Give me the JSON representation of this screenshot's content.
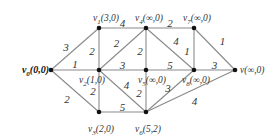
{
  "graph": {
    "nodes": [
      {
        "id": "v0",
        "label": "v0(0,0)",
        "name": "v",
        "sub": "0",
        "tail": "(0,0)",
        "x": 51,
        "y": 70,
        "bold": true
      },
      {
        "id": "v1",
        "label": "v1(3,0)",
        "name": "v",
        "sub": "1",
        "tail": "(3,0)",
        "x": 99,
        "y": 28
      },
      {
        "id": "v2",
        "label": "v2(1,0)",
        "name": "v",
        "sub": "2",
        "tail": "(1,0)",
        "x": 99,
        "y": 70
      },
      {
        "id": "v3",
        "label": "v3(2,0)",
        "name": "v",
        "sub": "3",
        "tail": "(2,0)",
        "x": 99,
        "y": 112
      },
      {
        "id": "v4",
        "label": "v4(∞,0)",
        "name": "v",
        "sub": "4",
        "tail": "(∞,0)",
        "x": 146,
        "y": 28
      },
      {
        "id": "v5",
        "label": "v5(∞,0)",
        "name": "v",
        "sub": "5",
        "tail": "(∞,0)",
        "x": 146,
        "y": 70
      },
      {
        "id": "v6",
        "label": "v6(5,2)",
        "name": "v",
        "sub": "6",
        "tail": "(5,2)",
        "x": 146,
        "y": 112
      },
      {
        "id": "v7",
        "label": "v7(∞,0)",
        "name": "v",
        "sub": "7",
        "tail": "(∞,0)",
        "x": 194,
        "y": 28
      },
      {
        "id": "v8",
        "label": "v8(∞,0)",
        "name": "v",
        "sub": "8",
        "tail": "(∞,0)",
        "x": 194,
        "y": 70
      },
      {
        "id": "v",
        "label": "v(∞,0)",
        "name": "v",
        "sub": "",
        "tail": "(∞,0)",
        "x": 235,
        "y": 70
      }
    ],
    "edges": [
      {
        "from": "v0",
        "to": "v1",
        "weight": "3"
      },
      {
        "from": "v0",
        "to": "v2",
        "weight": "1"
      },
      {
        "from": "v0",
        "to": "v3",
        "weight": "2"
      },
      {
        "from": "v1",
        "to": "v2",
        "weight": "2"
      },
      {
        "from": "v1",
        "to": "v4",
        "weight": "4"
      },
      {
        "from": "v2",
        "to": "v4",
        "weight": "2"
      },
      {
        "from": "v2",
        "to": "v5",
        "weight": "3"
      },
      {
        "from": "v2",
        "to": "v3",
        "weight": "2"
      },
      {
        "from": "v2",
        "to": "v6",
        "weight": "4"
      },
      {
        "from": "v3",
        "to": "v6",
        "weight": "5"
      },
      {
        "from": "v4",
        "to": "v5",
        "weight": "2"
      },
      {
        "from": "v4",
        "to": "v7",
        "weight": "2"
      },
      {
        "from": "v4",
        "to": "v8",
        "weight": "4"
      },
      {
        "from": "v5",
        "to": "v8",
        "weight": "5"
      },
      {
        "from": "v5",
        "to": "v6",
        "weight": "2"
      },
      {
        "from": "v7",
        "to": "v8",
        "weight": "1"
      },
      {
        "from": "v7",
        "to": "v",
        "weight": "1"
      },
      {
        "from": "v8",
        "to": "v",
        "weight": "3"
      },
      {
        "from": "v6",
        "to": "v8",
        "weight": "3"
      },
      {
        "from": "v6",
        "to": "v",
        "weight": "4"
      }
    ]
  },
  "labels": {
    "v0": "v0(0,0)",
    "v1": "v1(3,0)",
    "v2": "v2(1,0)",
    "v3": "v3(2,0)",
    "v4": "v4(∞,0)",
    "v5": "v5(∞,0)",
    "v6": "v6(5,2)",
    "v7": "v7(∞,0)",
    "v8": "v8(∞,0)",
    "v": "v(∞,0)"
  }
}
